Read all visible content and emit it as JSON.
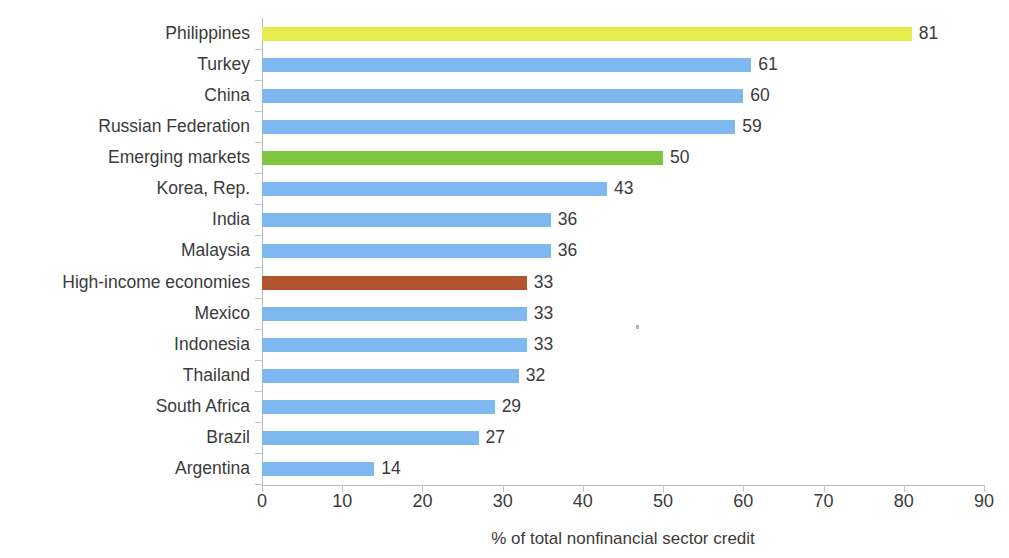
{
  "chart_data": {
    "type": "bar",
    "orientation": "horizontal",
    "title": "",
    "subtitle": "",
    "xlabel": "% of total nonfinancial sector credit",
    "ylabel": "",
    "xlim": [
      0,
      90
    ],
    "xticks": [
      "0",
      "10",
      "20",
      "30",
      "40",
      "50",
      "60",
      "70",
      "80",
      "90"
    ],
    "grid": false,
    "legend": null,
    "categories": [
      "Philippines",
      "Turkey",
      "China",
      "Russian Federation",
      "Emerging markets",
      "Korea, Rep.",
      "India",
      "Malaysia",
      "High-income economies",
      "Mexico",
      "Indonesia",
      "Thailand",
      "South Africa",
      "Brazil",
      "Argentina"
    ],
    "values": [
      81,
      61,
      60,
      59,
      50,
      43,
      36,
      36,
      33,
      33,
      33,
      32,
      29,
      27,
      14
    ],
    "value_labels": [
      "81",
      "61",
      "60",
      "59",
      "50",
      "43",
      "36",
      "36",
      "33",
      "33",
      "33",
      "32",
      "29",
      "27",
      "14"
    ],
    "bar_colors": [
      "#e6ec4b",
      "#7fb8f0",
      "#7fb8f0",
      "#7fb8f0",
      "#7ec63f",
      "#7fb8f0",
      "#7fb8f0",
      "#7fb8f0",
      "#b35430",
      "#7fb8f0",
      "#7fb8f0",
      "#7fb8f0",
      "#7fb8f0",
      "#7fb8f0",
      "#7fb8f0"
    ]
  },
  "colors": {
    "default_bar": "#7fb8f0",
    "highlight_yellow": "#e6ec4b",
    "highlight_green": "#7ec63f",
    "highlight_brown": "#b35430",
    "axis": "#b9b9b9",
    "text": "#3b3b3b",
    "background": "#ffffff"
  }
}
